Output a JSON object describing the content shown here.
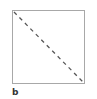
{
  "diagram": {
    "shape": "square",
    "border_color": "#a8a8a8",
    "diagonal": {
      "from": "top-left",
      "to": "bottom-right",
      "style": "dashed",
      "color": "#555555"
    },
    "label": "b"
  }
}
